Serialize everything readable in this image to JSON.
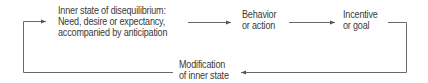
{
  "diagram": {
    "nodes": [
      {
        "id": "inner-state",
        "lines": [
          "Inner state of disequilibrium:",
          "Need, desire or expectancy,",
          "accompanied by anticipation"
        ]
      },
      {
        "id": "behavior",
        "lines": [
          "Behavior",
          "or action"
        ]
      },
      {
        "id": "incentive",
        "lines": [
          "Incentive",
          "or goal"
        ]
      },
      {
        "id": "modification",
        "lines": [
          "Modification",
          "of inner state"
        ]
      }
    ],
    "edges": [
      {
        "from": "inner-state",
        "to": "behavior"
      },
      {
        "from": "behavior",
        "to": "incentive"
      },
      {
        "from": "incentive",
        "to": "modification"
      },
      {
        "from": "modification",
        "to": "inner-state"
      }
    ],
    "line_color": "#6a6a6a"
  }
}
